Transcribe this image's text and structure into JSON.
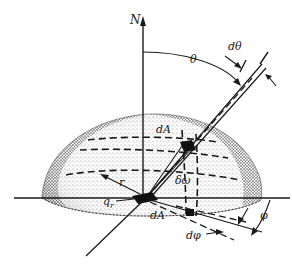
{
  "figure": {
    "type": "hemisphere radiation geometry diagram",
    "labels": {
      "north": "N",
      "theta": "θ",
      "dtheta": "dθ",
      "dA_top": "dA",
      "dA_center": "dA",
      "solid_angle": "δω",
      "radius": "r",
      "heat_flux": "q",
      "heat_flux_sub": "r",
      "phi": "φ",
      "dphi": "dφ"
    },
    "colors": {
      "ink": "#1a1a1a",
      "background": "#ffffff"
    }
  }
}
